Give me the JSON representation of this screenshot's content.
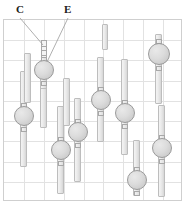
{
  "figure": {
    "kind": "patent-line-drawing",
    "background_color": "#ffffff",
    "callouts": [
      {
        "id": "C",
        "label": "C",
        "x": 16,
        "y": 4,
        "target_x": 43,
        "target_y": 45
      },
      {
        "id": "E",
        "label": "E",
        "x": 64,
        "y": 4,
        "target_x": 47,
        "target_y": 62
      }
    ],
    "panel": {
      "x": 3,
      "y": 19,
      "width": 179,
      "height": 182,
      "border_color": "#cfcfcf",
      "grid_color": "#e2e2e2",
      "grid_cols": 9,
      "grid_rows": 9,
      "grid_on": true
    },
    "style": {
      "bar_fill": "#ededed",
      "bar_stroke": "#bdbdbd",
      "circle_fill": "#dcdcdc",
      "circle_stroke": "#9a9a9a",
      "tab_fill": "#e8e8e8",
      "tab_stroke": "#a8a8a8",
      "label_color": "#202020",
      "leader_color": "#9a9a9a"
    },
    "assemblies": [
      {
        "name": "assembly-01",
        "bar_x": 40,
        "bar_y": 60,
        "bar_w": 7,
        "bar_h": 42,
        "circle_cx": 43.5,
        "circle_cy": 70,
        "circle_r": 10,
        "tab_top_y": 57,
        "tab_bottom_y": 81,
        "tab_w": 6,
        "tab_h": 5,
        "ladder": true,
        "ladder_y": 40,
        "ladder_h": 18,
        "ladder_w": 6,
        "ladder_rungs": 3
      },
      {
        "name": "assembly-02",
        "bar_x": 20,
        "bar_y": 71,
        "bar_w": 7,
        "bar_h": 96,
        "circle_cx": 23.5,
        "circle_cy": 116,
        "circle_r": 10,
        "tab_top_y": 103,
        "tab_bottom_y": 127,
        "tab_w": 6,
        "tab_h": 5,
        "ladder": false
      },
      {
        "name": "assembly-03",
        "bar_x": 40,
        "bar_y": 88,
        "bar_w": 7,
        "bar_h": 40,
        "circle_cx": 43.5,
        "circle_cy": 70,
        "circle_r": 0,
        "tab_top_y": -99,
        "tab_bottom_y": -99,
        "tab_w": 6,
        "tab_h": 5,
        "ladder": false
      },
      {
        "name": "assembly-04",
        "bar_x": 57,
        "bar_y": 106,
        "bar_w": 7,
        "bar_h": 88,
        "circle_cx": 60.5,
        "circle_cy": 150,
        "circle_r": 10,
        "tab_top_y": 137,
        "tab_bottom_y": 161,
        "tab_w": 6,
        "tab_h": 5,
        "ladder": false
      },
      {
        "name": "assembly-05",
        "bar_x": 74,
        "bar_y": 98,
        "bar_w": 7,
        "bar_h": 84,
        "circle_cx": 77.5,
        "circle_cy": 132,
        "circle_r": 10,
        "tab_top_y": 119,
        "tab_bottom_y": 143,
        "tab_w": 6,
        "tab_h": 5,
        "ladder": false
      },
      {
        "name": "assembly-06",
        "bar_x": 97,
        "bar_y": 57,
        "bar_w": 7,
        "bar_h": 85,
        "circle_cx": 100.5,
        "circle_cy": 100,
        "circle_r": 10,
        "tab_top_y": 87,
        "tab_bottom_y": 111,
        "tab_w": 6,
        "tab_h": 5,
        "ladder": false
      },
      {
        "name": "assembly-07",
        "bar_x": 121,
        "bar_y": 59,
        "bar_w": 7,
        "bar_h": 96,
        "circle_cx": 124.5,
        "circle_cy": 113,
        "circle_r": 10,
        "tab_top_y": 100,
        "tab_bottom_y": 124,
        "tab_w": 6,
        "tab_h": 5,
        "ladder": false
      },
      {
        "name": "assembly-08",
        "bar_x": 133,
        "bar_y": 140,
        "bar_w": 7,
        "bar_h": 56,
        "circle_cx": 136.5,
        "circle_cy": 180,
        "circle_r": 10,
        "tab_top_y": 167,
        "tab_bottom_y": 191,
        "tab_w": 6,
        "tab_h": 5,
        "ladder": false
      },
      {
        "name": "assembly-09",
        "bar_x": 155,
        "bar_y": 34,
        "bar_w": 7,
        "bar_h": 70,
        "circle_cx": 158.5,
        "circle_cy": 54,
        "circle_r": 11,
        "tab_top_y": 39,
        "tab_bottom_y": 66,
        "tab_w": 6,
        "tab_h": 5,
        "ladder": false
      },
      {
        "name": "assembly-10",
        "bar_x": 158,
        "bar_y": 105,
        "bar_w": 7,
        "bar_h": 92,
        "circle_cx": 161.5,
        "circle_cy": 148,
        "circle_r": 10,
        "tab_top_y": 135,
        "tab_bottom_y": 159,
        "tab_w": 6,
        "tab_h": 5,
        "ladder": false
      },
      {
        "name": "assembly-11",
        "bar_x": 102,
        "bar_y": 24,
        "bar_w": 6,
        "bar_h": 26,
        "circle_cx": 0,
        "circle_cy": 0,
        "circle_r": 0,
        "tab_top_y": -99,
        "tab_bottom_y": -99,
        "tab_w": 6,
        "tab_h": 5,
        "ladder": false
      },
      {
        "name": "assembly-12",
        "bar_x": 24,
        "bar_y": 53,
        "bar_w": 7,
        "bar_h": 50,
        "circle_cx": 0,
        "circle_cy": 0,
        "circle_r": 0,
        "tab_top_y": -99,
        "tab_bottom_y": -99,
        "tab_w": 6,
        "tab_h": 5,
        "ladder": false
      },
      {
        "name": "assembly-13",
        "bar_x": 63,
        "bar_y": 78,
        "bar_w": 7,
        "bar_h": 48,
        "circle_cx": 0,
        "circle_cy": 0,
        "circle_r": 0,
        "tab_top_y": -99,
        "tab_bottom_y": -99,
        "tab_w": 6,
        "tab_h": 5,
        "ladder": false
      }
    ]
  }
}
